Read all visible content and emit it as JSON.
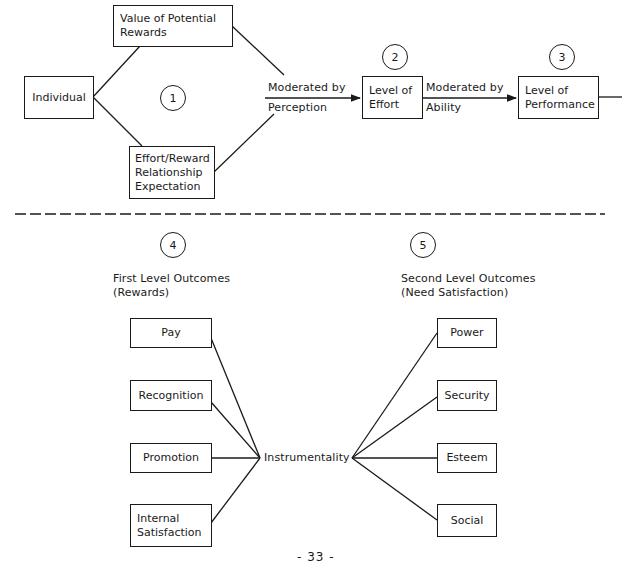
{
  "top_section": {
    "individual": "Individual",
    "value_box": {
      "line1": "Value of Potential",
      "line2": "Rewards"
    },
    "expectation_box": {
      "line1": "Effort/Reward",
      "line2": "Relationship",
      "line3": "Expectation"
    },
    "perception_arrow": {
      "above": "Moderated by",
      "below": "Perception"
    },
    "effort_box": {
      "line1": "Level of",
      "line2": "Effort"
    },
    "ability_arrow": {
      "above": "Moderated by",
      "below": "Ability"
    },
    "performance_box": {
      "line1": "Level of",
      "line2": "Performance"
    },
    "markers": [
      "1",
      "2",
      "3"
    ]
  },
  "bottom_section": {
    "markers": [
      "4",
      "5"
    ],
    "first_level": {
      "title": "First Level Outcomes",
      "subtitle": "(Rewards)"
    },
    "second_level": {
      "title": "Second Level Outcomes",
      "subtitle": "(Need Satisfaction)"
    },
    "first_level_items": [
      "Pay",
      "Recognition",
      "Promotion",
      "Internal",
      "Satisfaction"
    ],
    "hub": "Instrumentality",
    "second_level_items": [
      "Power",
      "Security",
      "Esteem",
      "Social"
    ]
  },
  "footer": {
    "page_number": "- 33 -"
  },
  "colors": {
    "ink": "#1a1a1a",
    "paper": "#ffffff"
  }
}
